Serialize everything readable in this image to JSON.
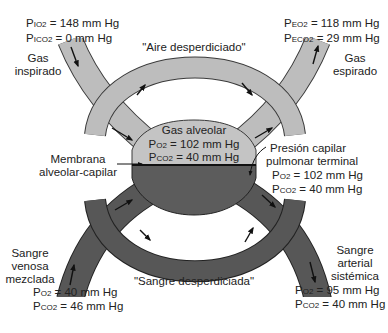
{
  "colors": {
    "gas_tube": "#bdbdbd",
    "gas_tube_stroke": "#3a3a3a",
    "blood_tube": "#575757",
    "blood_tube_stroke": "#222222",
    "alveolus_gas": "#c4c4c4",
    "alveolus_blood": "#5c5c5c",
    "arrow": "#111111",
    "text": "#222222"
  },
  "inspired": {
    "label_line1": "Gas",
    "label_line2": "inspirado",
    "o2_prefix": "P",
    "o2_sub": "IO2",
    "o2_value": " = 148 mm Hg",
    "co2_prefix": "P",
    "co2_sub": "ICO2",
    "co2_value": " = 0 mm Hg"
  },
  "expired": {
    "label_line1": "Gas",
    "label_line2": "espirado",
    "o2_prefix": "P",
    "o2_sub": "EO2",
    "o2_value": " = 118 mm Hg",
    "co2_prefix": "P",
    "co2_sub": "ECO2",
    "co2_value": " = 29 mm Hg"
  },
  "dead_space_air": "\"Aire desperdiciado\"",
  "alveolar_gas": {
    "label": "Gas alveolar",
    "o2_prefix": "P",
    "o2_sub": "O2",
    "o2_value": " = 102 mm Hg",
    "co2_prefix": "P",
    "co2_sub": "CO2",
    "co2_value": " = 40 mm Hg"
  },
  "membrane": {
    "line1": "Membrana",
    "line2": "alveolar-capilar"
  },
  "end_capillary": {
    "line1": "Presión capilar",
    "line2": "pulmonar terminal",
    "o2_prefix": "P",
    "o2_sub": "O2",
    "o2_value": " = 102 mm Hg",
    "co2_prefix": "P",
    "co2_sub": "CO2",
    "co2_value": " = 40 mm Hg"
  },
  "venous": {
    "line1": "Sangre",
    "line2": "venosa",
    "line3": "mezclada",
    "o2_prefix": "P",
    "o2_sub": "O2",
    "o2_value": " = 40 mm Hg",
    "co2_prefix": "P",
    "co2_sub": "CO2",
    "co2_value": " = 46 mm Hg"
  },
  "arterial": {
    "line1": "Sangre",
    "line2": "arterial",
    "line3": "sistémica",
    "o2_prefix": "P",
    "o2_sub": "O2",
    "o2_value": " = 95 mm Hg",
    "co2_prefix": "P",
    "co2_sub": "CO2",
    "co2_value": " = 40 mm Hg"
  },
  "shunt_blood": "\"Sangre desperdiciada\"",
  "icons": {
    "flow_arrow": "arrow-icon",
    "pointer_arrow": "pointer-arrow-icon"
  }
}
